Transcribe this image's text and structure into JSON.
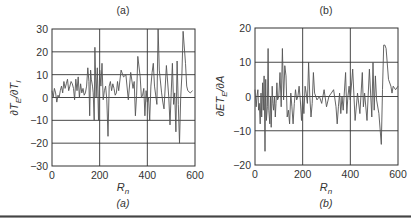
{
  "chart_data": [
    {
      "type": "line",
      "panel": "a",
      "title": "(a)",
      "caption": "(a)",
      "xlabel": "R_n",
      "xlabel_main": "R",
      "xlabel_sub": "n",
      "ylabel": "∂T_E/∂T_I",
      "ylabel_parts": {
        "a": "∂T",
        "b": "E",
        "c": "/∂T",
        "d": "I"
      },
      "xlim": [
        0,
        600
      ],
      "ylim": [
        -30,
        30
      ],
      "xticks": [
        0,
        200,
        400,
        600
      ],
      "yticks": [
        30,
        20,
        10,
        0,
        -10,
        -20,
        -30
      ],
      "xtick_labels": [
        "0",
        "200",
        "400",
        "600"
      ],
      "ytick_labels": [
        "30",
        "20",
        "10",
        "0",
        "−10",
        "−20",
        "−30"
      ],
      "grid": true,
      "series": [
        {
          "name": "dTE_dTI",
          "x": [
            0,
            5,
            10,
            15,
            20,
            25,
            30,
            35,
            40,
            45,
            50,
            55,
            60,
            65,
            70,
            75,
            80,
            85,
            90,
            95,
            100,
            105,
            110,
            115,
            120,
            125,
            130,
            135,
            140,
            145,
            150,
            155,
            158,
            162,
            165,
            170,
            173,
            177,
            180,
            185,
            190,
            195,
            200,
            205,
            210,
            215,
            220,
            225,
            230,
            235,
            240,
            245,
            250,
            255,
            260,
            265,
            270,
            275,
            280,
            290,
            300,
            310,
            320,
            330,
            340,
            345,
            350,
            355,
            360,
            370,
            375,
            380,
            385,
            390,
            395,
            400,
            405,
            410,
            415,
            420,
            425,
            430,
            440,
            445,
            450,
            460,
            465,
            470,
            480,
            490,
            495,
            500,
            505,
            510,
            515,
            520,
            525,
            530,
            535,
            540,
            545,
            550,
            560,
            565,
            570,
            580,
            590,
            595,
            600
          ],
          "y": [
            3,
            0,
            4,
            2,
            -2,
            1,
            0,
            3,
            5,
            2,
            7,
            4,
            6,
            8,
            3,
            5,
            7,
            6,
            4,
            -1,
            8,
            3,
            9,
            0,
            6,
            2,
            4,
            1,
            2,
            5,
            13,
            7,
            -8,
            12,
            8,
            5,
            2,
            -10,
            22,
            0,
            13,
            -10,
            12,
            5,
            15,
            -1,
            3,
            5,
            -1,
            -17,
            5,
            7,
            3,
            6,
            4,
            1,
            2,
            7,
            3,
            12,
            9,
            10,
            -1,
            11,
            4,
            7,
            -8,
            1,
            18,
            9,
            0,
            1,
            4,
            -8,
            3,
            -2,
            0,
            -10,
            5,
            11,
            15,
            5,
            -3,
            30,
            12,
            2,
            -2,
            -5,
            14,
            0,
            -12,
            2,
            15,
            -3,
            2,
            -15,
            16,
            -3,
            -20,
            0,
            10,
            29,
            15,
            5,
            3,
            2,
            3
          ]
        }
      ]
    },
    {
      "type": "line",
      "panel": "b",
      "title": "(b)",
      "caption": "(b)",
      "xlabel": "R_n",
      "xlabel_main": "R",
      "xlabel_sub": "n",
      "ylabel": "∂ET_E/∂A",
      "ylabel_parts": {
        "a": "∂ET",
        "b": "E",
        "c": "/∂A",
        "d": ""
      },
      "xlim": [
        0,
        600
      ],
      "ylim": [
        -20,
        20
      ],
      "xticks": [
        0,
        200,
        400,
        600
      ],
      "yticks": [
        20,
        10,
        0,
        -10,
        -20
      ],
      "xtick_labels": [
        "0",
        "200",
        "400",
        "600"
      ],
      "ytick_labels": [
        "20",
        "10",
        "0",
        "−10",
        "−20"
      ],
      "grid": true,
      "series": [
        {
          "name": "dETE_dA",
          "x": [
            0,
            5,
            8,
            12,
            15,
            18,
            22,
            25,
            28,
            32,
            35,
            38,
            42,
            45,
            48,
            52,
            55,
            58,
            62,
            65,
            68,
            72,
            75,
            78,
            82,
            85,
            88,
            92,
            95,
            100,
            105,
            110,
            115,
            120,
            125,
            130,
            135,
            140,
            145,
            150,
            155,
            160,
            165,
            170,
            175,
            180,
            185,
            190,
            195,
            200,
            205,
            210,
            215,
            220,
            225,
            230,
            235,
            240,
            245,
            250,
            260,
            270,
            280,
            290,
            300,
            310,
            320,
            330,
            340,
            345,
            350,
            355,
            360,
            365,
            370,
            380,
            385,
            390,
            395,
            400,
            410,
            420,
            430,
            440,
            450,
            455,
            460,
            470,
            480,
            490,
            495,
            500,
            505,
            510,
            520,
            530,
            535,
            540,
            545,
            550,
            560,
            570,
            575,
            580,
            590,
            600
          ],
          "y": [
            2,
            -3,
            0,
            2,
            -4,
            -2,
            -8,
            1,
            -6,
            4,
            -4,
            6,
            -16,
            5,
            -7,
            -3,
            14,
            -4,
            -8,
            0,
            -9,
            3,
            -2,
            -4,
            0,
            -6,
            -2,
            4,
            -1,
            0,
            7,
            -3,
            14,
            -1,
            9,
            6,
            -6,
            -4,
            -8,
            1,
            -3,
            -8,
            -2,
            2,
            -1,
            0,
            3,
            -1,
            -7,
            0,
            -5,
            3,
            1,
            -2,
            10,
            0,
            -6,
            -2,
            7,
            1,
            -1,
            0,
            -2,
            2,
            -3,
            0,
            1,
            2,
            -3,
            -8,
            -3,
            1,
            -5,
            0,
            -4,
            7,
            -5,
            0,
            3,
            -1,
            8,
            -7,
            1,
            -5,
            7,
            -3,
            1,
            -7,
            8,
            -6,
            10,
            -4,
            6,
            -1,
            -5,
            -14,
            2,
            15,
            15,
            14,
            5,
            3,
            1,
            3,
            2,
            3
          ]
        }
      ]
    }
  ],
  "figure": {
    "panel_a_caption": "(a)",
    "panel_b_caption": "(b)",
    "panel_a_title": "(a)",
    "panel_b_title": "(b)"
  }
}
